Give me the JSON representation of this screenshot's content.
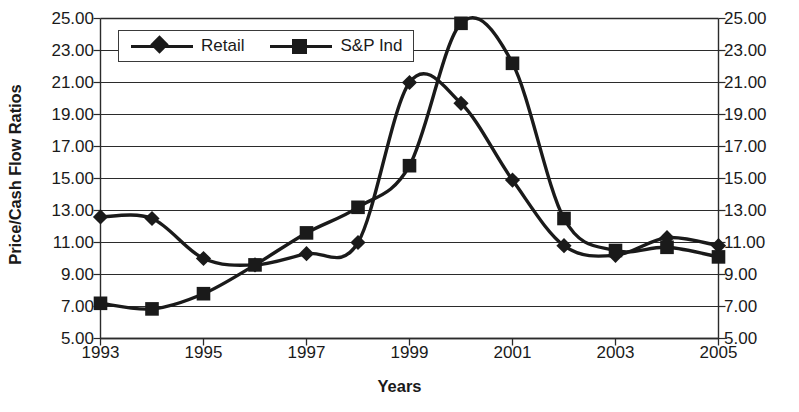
{
  "chart_data": {
    "type": "line",
    "title": "",
    "xlabel": "Years",
    "ylabel": "Price/Cash Flow Ratios",
    "x": [
      1993,
      1994,
      1995,
      1996,
      1997,
      1998,
      1999,
      2000,
      2001,
      2002,
      2003,
      2004,
      2005
    ],
    "xtick_labels": [
      "1993",
      "1995",
      "1997",
      "1999",
      "2001",
      "2003",
      "2005"
    ],
    "xtick_values": [
      1993,
      1995,
      1997,
      1999,
      2001,
      2003,
      2005
    ],
    "xlim": [
      1993,
      2005
    ],
    "ylim": [
      5.0,
      25.0
    ],
    "ytick_labels": [
      "25.00",
      "23.00",
      "21.00",
      "19.00",
      "17.00",
      "15.00",
      "13.00",
      "11.00",
      "9.00",
      "7.00",
      "5.00"
    ],
    "ytick_values": [
      25,
      23,
      21,
      19,
      17,
      15,
      13,
      11,
      9,
      7,
      5
    ],
    "grid": "horizontal",
    "dual_y_axis": true,
    "legend_position": "top-left inside plot",
    "series": [
      {
        "name": "Retail",
        "marker": "diamond",
        "color": "#1a1a1a",
        "values": [
          12.6,
          12.5,
          10.0,
          9.6,
          10.3,
          11.0,
          21.0,
          19.7,
          14.9,
          10.8,
          10.2,
          11.3,
          10.8
        ]
      },
      {
        "name": "S&P Ind",
        "marker": "square",
        "color": "#1a1a1a",
        "values": [
          7.2,
          6.85,
          7.8,
          9.6,
          11.6,
          13.2,
          15.8,
          24.7,
          22.2,
          12.5,
          10.5,
          10.7,
          10.1
        ]
      }
    ]
  },
  "legend": {
    "entries": [
      {
        "label": "Retail",
        "marker": "diamond-marker-icon"
      },
      {
        "label": "S&P Ind",
        "marker": "square-marker-icon"
      }
    ]
  },
  "axes": {
    "y_title": "Price/Cash Flow Ratios",
    "x_title": "Years"
  }
}
